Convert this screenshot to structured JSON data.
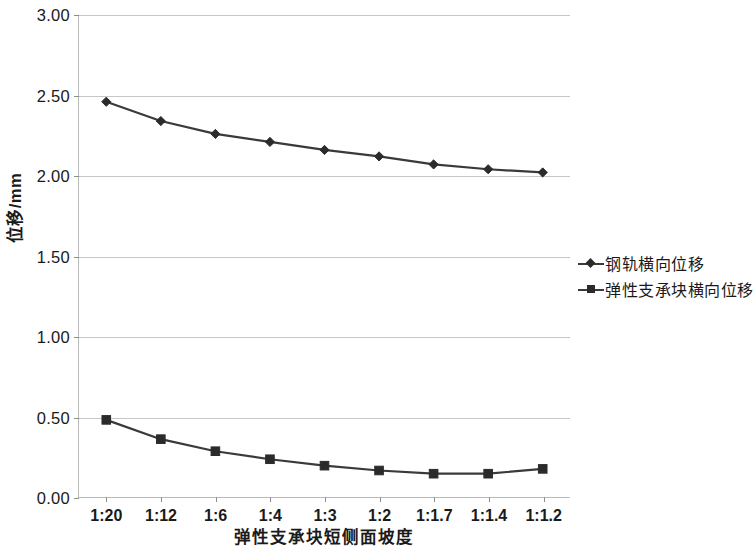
{
  "chart_data": {
    "type": "line",
    "title": "",
    "xlabel": "弹性支承块短侧面坡度",
    "ylabel": "位移/mm",
    "categories": [
      "1:20",
      "1:12",
      "1:6",
      "1:4",
      "1:3",
      "1:2",
      "1:1.7",
      "1:1.4",
      "1:1.2"
    ],
    "ylim": [
      0.0,
      3.0
    ],
    "ytick_labels": [
      "3.00",
      "2.50",
      "2.00",
      "1.50",
      "1.00",
      "0.50",
      "0.00"
    ],
    "ytick_values": [
      3.0,
      2.5,
      2.0,
      1.5,
      1.0,
      0.5,
      0.0
    ],
    "grid": true,
    "legend_position": "right",
    "series": [
      {
        "name": "钢轨横向位移",
        "marker": "diamond",
        "color": "#3a3a3a",
        "values": [
          2.46,
          2.34,
          2.26,
          2.21,
          2.16,
          2.12,
          2.07,
          2.04,
          2.02
        ]
      },
      {
        "name": "弹性支承块横向位移",
        "marker": "square",
        "color": "#3a3a3a",
        "values": [
          0.48,
          0.36,
          0.285,
          0.235,
          0.195,
          0.165,
          0.145,
          0.145,
          0.175
        ]
      }
    ]
  },
  "colors": {
    "series": "#3a3a3a",
    "gridline": "#c6c6c6",
    "axis": "#b9b9b9",
    "text": "#1a1a1a",
    "background": "#ffffff"
  }
}
